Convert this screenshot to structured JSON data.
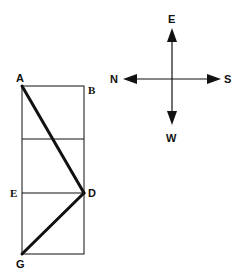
{
  "diagram": {
    "points": {
      "A": "A",
      "B": "B",
      "D": "D",
      "E": "E",
      "G": "G"
    },
    "compass": {
      "up": "E",
      "down": "W",
      "left": "N",
      "right": "S"
    },
    "colors": {
      "stroke": "#111111",
      "background": "#ffffff"
    }
  }
}
